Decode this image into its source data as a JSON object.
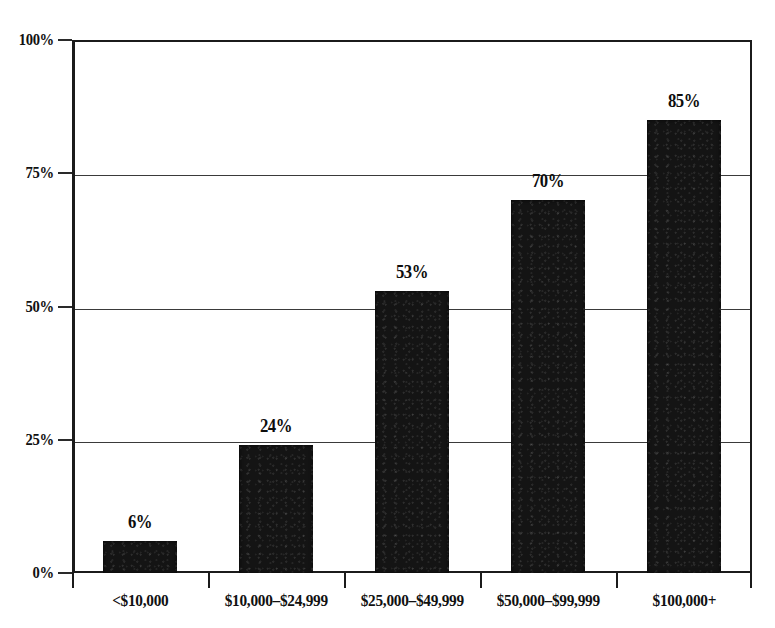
{
  "chart_data": {
    "type": "bar",
    "title": "",
    "subtitle": "",
    "xlabel": "",
    "ylabel": "",
    "categories": [
      "<$10,000",
      "$10,000–$24,999",
      "$25,000–$49,999",
      "$50,000–$99,999",
      "$100,000+"
    ],
    "values": [
      6,
      24,
      53,
      70,
      85
    ],
    "value_labels": [
      "6%",
      "24%",
      "53%",
      "70%",
      "85%"
    ],
    "ylim": [
      0,
      100
    ],
    "y_ticks": [
      0,
      25,
      50,
      75,
      100
    ],
    "y_tick_labels": [
      "0%",
      "25%",
      "50%",
      "75%",
      "100%"
    ],
    "grid": true,
    "grid_axis": "y",
    "legend": false,
    "legend_position": "none",
    "series": [
      {
        "name": "",
        "values": [
          6,
          24,
          53,
          70,
          85
        ]
      }
    ],
    "colors": {
      "bar": "#141414",
      "axis": "#1b1b1b",
      "gridline": "#3a3a3a",
      "text": "#111111",
      "background": "#ffffff"
    }
  },
  "axes": {
    "y": {
      "ticks": [
        {
          "label": "100%",
          "value": 100
        },
        {
          "label": "75%",
          "value": 75
        },
        {
          "label": "50%",
          "value": 50
        },
        {
          "label": "25%",
          "value": 25
        },
        {
          "label": "0%",
          "value": 0
        }
      ]
    },
    "x": {
      "ticks": [
        {
          "label": "<$10,000"
        },
        {
          "label": "$10,000–$24,999"
        },
        {
          "label": "$25,000–$49,999"
        },
        {
          "label": "$50,000–$99,999"
        },
        {
          "label": "$100,000+"
        }
      ]
    }
  }
}
